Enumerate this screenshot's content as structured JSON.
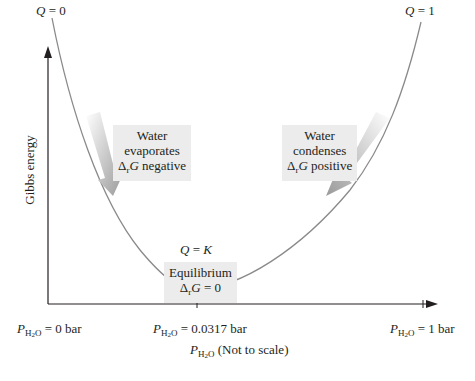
{
  "diagram": {
    "y_axis_label": "Gibbs energy",
    "x_axis_label_suffix": "(Not to scale)",
    "x_axis_var": "P",
    "x_axis_var_sub": "H",
    "x_axis_var_sub2": "2",
    "x_axis_var_sub3": "O",
    "top_left": {
      "q": "Q",
      "eq": " = 0"
    },
    "top_right": {
      "q": "Q",
      "eq": " = 1"
    },
    "min_label": {
      "q": "Q",
      "eq": " = ",
      "k": "K"
    },
    "ticks": [
      {
        "value": " = 0 bar"
      },
      {
        "value": " = 0.0317 bar"
      },
      {
        "value": " = 1 bar"
      }
    ],
    "left_box": {
      "line1": "Water",
      "line2": "evaporates",
      "delta": "Δ",
      "sub": "r",
      "g": "G",
      "rest": " negative"
    },
    "right_box": {
      "line1": "Water",
      "line2": "condenses",
      "delta": "Δ",
      "sub": "r",
      "g": "G",
      "rest": " positive"
    },
    "center_box": {
      "line1": "Equilibrium",
      "delta": "Δ",
      "sub": "r",
      "g": "G",
      "rest": " = 0"
    },
    "colors": {
      "axis": "#231f20",
      "curve": "#8a8a8a",
      "arrow": "#a0a0a0",
      "box_bg": "#ececec"
    }
  }
}
